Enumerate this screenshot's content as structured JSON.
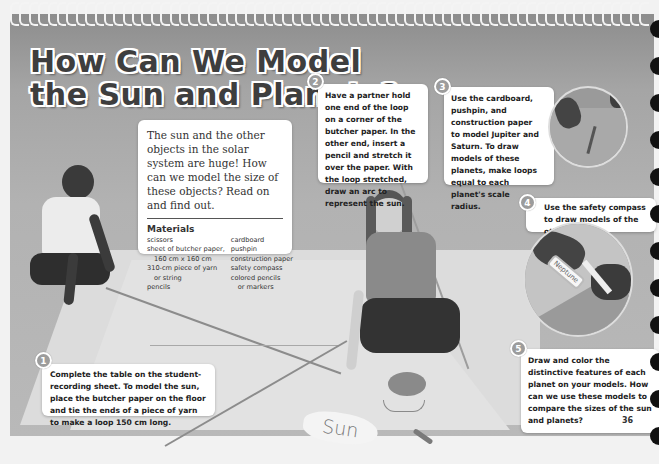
{
  "title": {
    "line1": "How Can We Model",
    "line2": "the Sun and Planets?"
  },
  "intro": {
    "text": "The sun and the other objects in the solar system are huge! How can we model the size of these objects? Read on and find out.",
    "materials_heading": "Materials",
    "materials_left": [
      {
        "text": "scissors",
        "indent": false
      },
      {
        "text": "sheet of butcher paper,",
        "indent": false
      },
      {
        "text": "160 cm x 160 cm",
        "indent": true
      },
      {
        "text": "310-cm piece of yarn",
        "indent": false
      },
      {
        "text": "or string",
        "indent": true
      },
      {
        "text": "pencils",
        "indent": false
      }
    ],
    "materials_right": [
      {
        "text": "cardboard",
        "indent": false
      },
      {
        "text": "pushpin",
        "indent": false
      },
      {
        "text": "construction paper",
        "indent": false
      },
      {
        "text": "safety compass",
        "indent": false
      },
      {
        "text": "colored pencils",
        "indent": false
      },
      {
        "text": "or markers",
        "indent": true
      }
    ]
  },
  "steps": [
    {
      "number": "1",
      "text": "Complete the table on the student-recording sheet. To model the sun, place the butcher paper on the floor and tie the ends of a piece of yarn to make a loop 150 cm long."
    },
    {
      "number": "2",
      "text": "Have a partner hold one end of the loop on a corner of the butcher paper. In the other end, insert a pencil and stretch it over the paper. With the loop stretched, draw an arc to represent the sun."
    },
    {
      "number": "3",
      "text": "Use the cardboard, pushpin, and construction paper to model Jupiter and Saturn. To draw models of these planets, make loops equal to each planet's scale radius."
    },
    {
      "number": "4",
      "text": "Use the safety compass to draw models of the other planets."
    },
    {
      "number": "5",
      "text": "Draw and color the distinctive features of each planet on your models. How can we use these models to compare the sizes of the sun and planets?"
    }
  ],
  "labels": {
    "sun": "Sun",
    "neptune": "Neptune"
  },
  "page_number": "36",
  "colors": {
    "title_fill": "#3e3e3e",
    "badge": "#9c9c9c",
    "card_bg": "#ffffff"
  }
}
